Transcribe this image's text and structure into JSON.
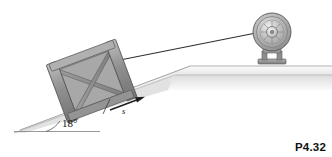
{
  "figure": {
    "id_label": "P4.32",
    "caption_number": "P4.32",
    "background_color": "#ffffff",
    "type": "mechanics-diagram"
  },
  "annotations": {
    "incline_angle": "18°",
    "incline_angle_value": 18,
    "incline_angle_units": "degrees",
    "displacement_label": "s",
    "displacement_arrow_direction": "up-the-incline"
  },
  "objects": {
    "crate": {
      "name": "crate",
      "description": "braced wooden crate resting on incline",
      "frame_color": "#8d8d8d",
      "face_color": "#a9a9a9",
      "brace_color": "#8a8a8a",
      "edge_color": "#555555"
    },
    "pulley": {
      "name": "pulley",
      "description": "grooved metal pulley wheel on pedestal bracket",
      "rim_color": "#9b9b9b",
      "hub_color": "#c9c9c9",
      "base_color": "#8f8f8f"
    },
    "cable": {
      "name": "cable",
      "description": "taut cable from crate to pulley",
      "color": "#2e2e2e"
    },
    "ground": {
      "name": "ground",
      "description": "inclined slope rising to level plateau",
      "top_color": "#f2f2f2",
      "face_color": "#d8d8d8",
      "edge_color": "#8c8c8c"
    }
  },
  "colors": {
    "ink": "#111111",
    "metal_light": "#e3e3e3",
    "metal_mid": "#a2a2a2",
    "metal_dark": "#6e6e6e",
    "line": "#444444"
  }
}
